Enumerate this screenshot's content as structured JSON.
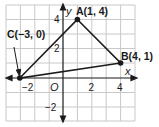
{
  "figure": {
    "axes": {
      "x_label": "x",
      "y_label": "y",
      "origin_label": "O",
      "x_ticks": [
        {
          "value": -2,
          "label": "−2"
        },
        {
          "value": 2,
          "label": "2"
        },
        {
          "value": 4,
          "label": "4"
        }
      ],
      "y_ticks": [
        {
          "value": 4,
          "label": "4"
        },
        {
          "value": 2,
          "label": "2"
        },
        {
          "value": -2,
          "label": "−2"
        }
      ],
      "x_range": [
        -4,
        5
      ],
      "y_range": [
        -3,
        5
      ]
    },
    "points": [
      {
        "name": "A",
        "x": 1,
        "y": 4,
        "label": "A(1, 4)"
      },
      {
        "name": "B",
        "x": 4,
        "y": 1,
        "label": "B(4, 1)"
      },
      {
        "name": "C",
        "x": -3,
        "y": 0,
        "label": "C(−3, 0)"
      }
    ],
    "colors": {
      "grid": "#c8c8c8",
      "axis": "#1a1a1a",
      "triangle": "#1a1a1a",
      "background": "#ffffff"
    }
  }
}
